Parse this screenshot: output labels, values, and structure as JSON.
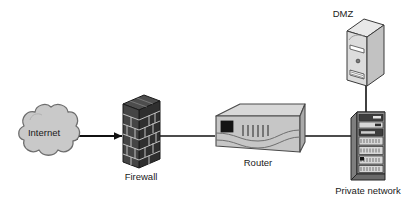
{
  "diagram": {
    "type": "network-topology",
    "title": "",
    "background_color": "#ffffff",
    "nodes": [
      {
        "id": "internet",
        "icon": "cloud-icon",
        "label": "Internet",
        "label_position": "inside",
        "fill": "#c9c9c9",
        "stroke": "#6e6e6e"
      },
      {
        "id": "firewall",
        "icon": "brick-wall-icon",
        "label": "Firewall",
        "label_position": "below",
        "fill": "#3b3b3b",
        "stroke": "#1a1a1a"
      },
      {
        "id": "router",
        "icon": "router-icon",
        "label": "Router",
        "label_position": "below",
        "fill": "#cfcfcf",
        "stroke": "#4a4a4a"
      },
      {
        "id": "dmz",
        "icon": "pc-tower-icon",
        "label": "DMZ",
        "label_position": "above-left",
        "fill": "#e2e2e2",
        "stroke": "#3a3a3a"
      },
      {
        "id": "private-network",
        "icon": "server-rack-icon",
        "label": "Private network",
        "label_position": "below",
        "fill": "#9a9a9a",
        "stroke": "#242424"
      }
    ],
    "links": [
      {
        "id": "internet-firewall",
        "from": "internet",
        "to": "firewall",
        "style": "double-arrow",
        "color": "#111111"
      },
      {
        "id": "firewall-router",
        "from": "firewall",
        "to": "router",
        "style": "line",
        "color": "#111111"
      },
      {
        "id": "router-private-network",
        "from": "router",
        "to": "private-network",
        "style": "line",
        "color": "#111111"
      },
      {
        "id": "dmz-private-network",
        "from": "dmz",
        "to": "private-network",
        "style": "line",
        "color": "#111111"
      }
    ]
  }
}
